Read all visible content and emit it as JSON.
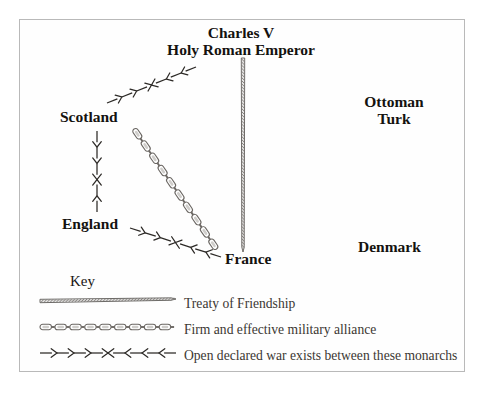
{
  "diagram": {
    "title_hidden": "",
    "background": "#ffffff",
    "frame_color": "#b9b9b9",
    "ink_color": "#14120f",
    "nodes": [
      {
        "id": "charles",
        "label_line1": "Charles V",
        "label_line2": "Holy Roman Emperor",
        "x": 241,
        "y": 24
      },
      {
        "id": "scotland",
        "label_line1": "Scotland",
        "label_line2": "",
        "x": 60,
        "y": 108
      },
      {
        "id": "england",
        "label_line1": "England",
        "label_line2": "",
        "x": 62,
        "y": 215
      },
      {
        "id": "france",
        "label_line1": "France",
        "label_line2": "",
        "x": 225,
        "y": 250
      },
      {
        "id": "ottoman",
        "label_line1": "Ottoman",
        "label_line2": "Turk",
        "x": 394,
        "y": 93
      },
      {
        "id": "denmark",
        "label_line1": "Denmark",
        "label_line2": "",
        "x": 358,
        "y": 238
      }
    ],
    "edges": [
      {
        "from": "charles",
        "to": "france",
        "style": "rope",
        "x1": 243,
        "y1": 58,
        "x2": 243,
        "y2": 252
      },
      {
        "from": "scotland",
        "to": "france",
        "style": "chain",
        "x1": 134,
        "y1": 129,
        "x2": 218,
        "y2": 251
      },
      {
        "from": "scotland",
        "to": "charles",
        "style": "war",
        "x1": 107,
        "y1": 103,
        "x2": 196,
        "y2": 67
      },
      {
        "from": "scotland",
        "to": "england",
        "style": "war",
        "x1": 97,
        "y1": 131,
        "x2": 97,
        "y2": 212
      },
      {
        "from": "england",
        "to": "france",
        "style": "war",
        "x1": 130,
        "y1": 228,
        "x2": 221,
        "y2": 257
      }
    ],
    "key": {
      "title": "Key",
      "entries": [
        {
          "style": "rope",
          "label": "Treaty of Friendship",
          "x1": 40,
          "y1": 301,
          "x2": 176,
          "y2": 299
        },
        {
          "style": "chain",
          "label": "Firm and effective military alliance",
          "x1": 40,
          "y1": 327,
          "x2": 176,
          "y2": 327
        },
        {
          "style": "war",
          "label": "Open declared war exists between these monarchs",
          "x1": 40,
          "y1": 353,
          "x2": 176,
          "y2": 353
        }
      ]
    }
  }
}
